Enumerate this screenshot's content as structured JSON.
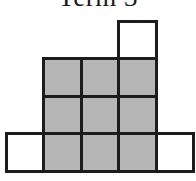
{
  "figure": {
    "title": "Term 3",
    "grid": {
      "rows": 4,
      "cols": 5
    },
    "cells": [
      {
        "row": 0,
        "col": 3,
        "shaded": false
      },
      {
        "row": 1,
        "col": 1,
        "shaded": true
      },
      {
        "row": 1,
        "col": 2,
        "shaded": true
      },
      {
        "row": 1,
        "col": 3,
        "shaded": true
      },
      {
        "row": 2,
        "col": 1,
        "shaded": true
      },
      {
        "row": 2,
        "col": 2,
        "shaded": true
      },
      {
        "row": 2,
        "col": 3,
        "shaded": true
      },
      {
        "row": 3,
        "col": 0,
        "shaded": false
      },
      {
        "row": 3,
        "col": 1,
        "shaded": true
      },
      {
        "row": 3,
        "col": 2,
        "shaded": true
      },
      {
        "row": 3,
        "col": 3,
        "shaded": true
      },
      {
        "row": 3,
        "col": 4,
        "shaded": false
      }
    ]
  },
  "colors": {
    "background": "#ffffff",
    "cell_border": "#1c1c1c",
    "shaded_fill": "#b6b6b6",
    "shaded_dot": "#8f8f8f",
    "unshaded_fill": "#ffffff",
    "title_color": "#1a1a1a"
  }
}
